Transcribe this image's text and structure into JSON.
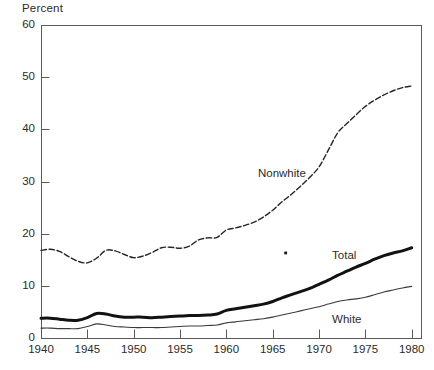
{
  "chart_data": {
    "type": "line",
    "title": "",
    "ylabel": "Percent",
    "xlabel": "",
    "ylim": [
      0,
      60
    ],
    "xlim": [
      1940,
      1981
    ],
    "grid": false,
    "legend_position": "inline-annotations",
    "yticks": [
      0,
      10,
      20,
      30,
      40,
      50,
      60
    ],
    "ytick_labels": [
      "0",
      "10",
      "20",
      "30",
      "40",
      "50",
      "60"
    ],
    "xticks": [
      1940,
      1945,
      1950,
      1955,
      1960,
      1965,
      1970,
      1975,
      1980
    ],
    "xtick_labels": [
      "1940",
      "1945",
      "1950",
      "1955",
      "1960",
      "1965",
      "1970",
      "1975",
      "1980"
    ],
    "annotations": [
      {
        "text": "Nonwhite",
        "x": 1966,
        "y": 31.5
      },
      {
        "text": "Total",
        "x": 1974,
        "y": 15.8
      },
      {
        "text": "White",
        "x": 1974,
        "y": 3.5
      }
    ],
    "series": [
      {
        "name": "Nonwhite",
        "style": "dashed",
        "color": "#262626",
        "width": 1.4,
        "x": [
          1940,
          1941,
          1942,
          1943,
          1944,
          1945,
          1946,
          1947,
          1948,
          1949,
          1950,
          1951,
          1952,
          1953,
          1954,
          1955,
          1956,
          1957,
          1958,
          1959,
          1960,
          1961,
          1962,
          1963,
          1964,
          1965,
          1966,
          1967,
          1968,
          1969,
          1970,
          1971,
          1972,
          1973,
          1974,
          1975,
          1976,
          1977,
          1978,
          1979,
          1980
        ],
        "values": [
          16.8,
          17.0,
          16.6,
          15.6,
          14.7,
          14.4,
          15.3,
          16.8,
          16.7,
          16.0,
          15.4,
          15.7,
          16.4,
          17.3,
          17.4,
          17.2,
          17.6,
          18.8,
          19.2,
          19.3,
          20.7,
          21.1,
          21.6,
          22.2,
          23.2,
          24.5,
          26.1,
          27.5,
          29.1,
          30.8,
          32.8,
          36.0,
          39.3,
          41.1,
          42.8,
          44.4,
          45.6,
          46.6,
          47.4,
          48.0,
          48.3
        ]
      },
      {
        "name": "Total",
        "style": "solid-bold",
        "color": "#121212",
        "width": 3.0,
        "x": [
          1940,
          1941,
          1942,
          1943,
          1944,
          1945,
          1946,
          1947,
          1948,
          1949,
          1950,
          1951,
          1952,
          1953,
          1954,
          1955,
          1956,
          1957,
          1958,
          1959,
          1960,
          1961,
          1962,
          1963,
          1964,
          1965,
          1966,
          1967,
          1968,
          1969,
          1970,
          1971,
          1972,
          1973,
          1974,
          1975,
          1976,
          1977,
          1978,
          1979,
          1980
        ],
        "values": [
          3.8,
          3.8,
          3.6,
          3.4,
          3.4,
          3.9,
          4.7,
          4.6,
          4.2,
          4.0,
          4.0,
          4.0,
          3.9,
          4.0,
          4.1,
          4.2,
          4.3,
          4.3,
          4.4,
          4.6,
          5.3,
          5.6,
          5.9,
          6.2,
          6.5,
          7.0,
          7.7,
          8.3,
          8.9,
          9.5,
          10.3,
          11.1,
          12.0,
          12.8,
          13.6,
          14.3,
          15.1,
          15.8,
          16.3,
          16.7,
          17.3
        ]
      },
      {
        "name": "White",
        "style": "solid-thin",
        "color": "#3a3a3a",
        "width": 1.1,
        "x": [
          1940,
          1941,
          1942,
          1943,
          1944,
          1945,
          1946,
          1947,
          1948,
          1949,
          1950,
          1951,
          1952,
          1953,
          1954,
          1955,
          1956,
          1957,
          1958,
          1959,
          1960,
          1961,
          1962,
          1963,
          1964,
          1965,
          1966,
          1967,
          1968,
          1969,
          1970,
          1971,
          1972,
          1973,
          1974,
          1975,
          1976,
          1977,
          1978,
          1979,
          1980
        ],
        "values": [
          1.9,
          1.9,
          1.8,
          1.8,
          1.8,
          2.2,
          2.7,
          2.5,
          2.2,
          2.1,
          2.0,
          2.0,
          2.0,
          2.0,
          2.1,
          2.2,
          2.3,
          2.3,
          2.4,
          2.5,
          2.9,
          3.1,
          3.3,
          3.5,
          3.7,
          4.0,
          4.4,
          4.8,
          5.2,
          5.6,
          6.0,
          6.5,
          7.0,
          7.3,
          7.5,
          7.8,
          8.3,
          8.8,
          9.2,
          9.6,
          9.9
        ]
      }
    ],
    "axis": {
      "frame_color": "#5a5a5a",
      "plot_bg": "#ffffff"
    },
    "stray_mark": {
      "x": 1966.4,
      "y": 16.3
    }
  }
}
